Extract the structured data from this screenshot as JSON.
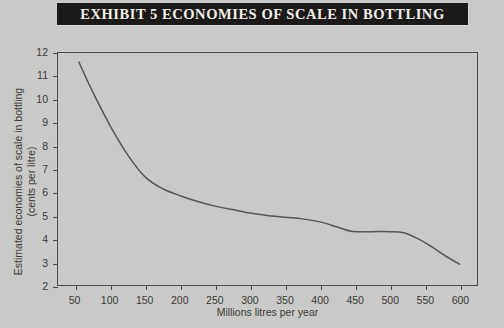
{
  "title": {
    "exhibit_label": "EXHIBIT 5",
    "caption": "ECONOMIES OF SCALE IN BOTTLING",
    "full": "EXHIBIT 5   ECONOMIES OF SCALE IN BOTTLING"
  },
  "colors": {
    "page_background": "#c9c9c7",
    "banner_background": "#1b1a18",
    "banner_text": "#f2efe9",
    "axis": "#4a4a48",
    "curve": "#55565a",
    "tick_text": "#3a3a38"
  },
  "chart_data": {
    "type": "line",
    "title": "EXHIBIT 5   ECONOMIES OF SCALE IN BOTTLING",
    "xlabel": "Millions litres per year",
    "ylabel": "Estimated economies of scale in bottling (cents per litre)",
    "ylabel_line1": "Estimated economies of scale in bottling",
    "ylabel_line2": "(cents per litre)",
    "xlim": [
      25,
      625
    ],
    "ylim": [
      2,
      12
    ],
    "xticks": [
      50,
      100,
      150,
      200,
      250,
      300,
      350,
      400,
      450,
      500,
      550,
      600
    ],
    "xtick_labels": [
      "50",
      "100",
      "150",
      "200",
      "250",
      "300",
      "350",
      "400",
      "450",
      "500",
      "550",
      "600"
    ],
    "yticks": [
      2,
      3,
      4,
      5,
      6,
      7,
      8,
      9,
      10,
      11,
      12
    ],
    "ytick_labels": [
      "2",
      "3",
      "4",
      "5",
      "6",
      "7",
      "8",
      "9",
      "10",
      "11",
      "12"
    ],
    "grid": false,
    "legend": false,
    "series": [
      {
        "name": "Estimated economies of scale in bottling",
        "x": [
          55,
          75,
          100,
          125,
          150,
          175,
          200,
          225,
          250,
          275,
          300,
          325,
          350,
          375,
          400,
          425,
          445,
          470,
          500,
          520,
          540,
          560,
          580,
          600
        ],
        "y": [
          11.6,
          10.3,
          8.85,
          7.6,
          6.65,
          6.15,
          5.85,
          5.6,
          5.4,
          5.25,
          5.1,
          5.0,
          4.92,
          4.85,
          4.72,
          4.5,
          4.32,
          4.3,
          4.3,
          4.25,
          4.0,
          3.65,
          3.25,
          2.9
        ]
      }
    ]
  }
}
